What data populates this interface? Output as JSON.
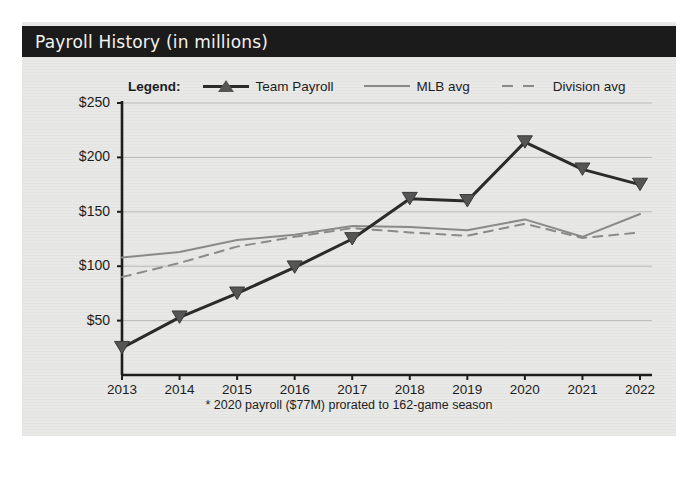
{
  "panel": {
    "title": "Payroll History (in millions)",
    "title_bg": "#1b1b1b",
    "title_color": "#f2f2ef",
    "background": "#e8e8e6"
  },
  "legend": {
    "label": "Legend:",
    "items": [
      {
        "name": "Team Payroll",
        "style": "solid-marker",
        "color": "#2b2b2b",
        "marker": "triangle"
      },
      {
        "name": "MLB avg",
        "style": "solid",
        "color": "#8a8a8a",
        "marker": "none"
      },
      {
        "name": "Division avg",
        "style": "dashed",
        "color": "#8a8a8a",
        "marker": "none"
      }
    ]
  },
  "footnote": "* 2020 payroll ($77M) prorated to 162-game season",
  "chart_data": {
    "type": "line",
    "title": "Payroll History (in millions)",
    "xlabel": "",
    "ylabel": "",
    "x": [
      "2013",
      "2014",
      "2015",
      "2016",
      "2017",
      "2018",
      "2019",
      "2020",
      "2021",
      "2022"
    ],
    "categories": [
      "2013",
      "2014",
      "2015",
      "2016",
      "2017",
      "2018",
      "2019",
      "2020",
      "2021",
      "2022"
    ],
    "ylim": [
      0,
      250
    ],
    "yticks": [
      50,
      100,
      150,
      200,
      250
    ],
    "ytick_labels": [
      "$50",
      "$100",
      "$150",
      "$200",
      "$250"
    ],
    "grid": true,
    "legend_position": "top",
    "series": [
      {
        "name": "Team Payroll",
        "color": "#2b2b2b",
        "style": "solid",
        "marker": "triangle",
        "values": [
          25,
          53,
          75,
          99,
          125,
          162,
          160,
          214,
          189,
          175
        ]
      },
      {
        "name": "MLB avg",
        "color": "#8a8a8a",
        "style": "solid",
        "marker": "none",
        "values": [
          108,
          113,
          124,
          129,
          137,
          136,
          133,
          143,
          127,
          148
        ]
      },
      {
        "name": "Division avg",
        "color": "#8a8a8a",
        "style": "dashed",
        "marker": "none",
        "values": [
          90,
          103,
          118,
          127,
          135,
          131,
          128,
          139,
          126,
          131
        ]
      }
    ],
    "annotations": [
      "* 2020 payroll ($77M) prorated to 162-game season"
    ]
  }
}
